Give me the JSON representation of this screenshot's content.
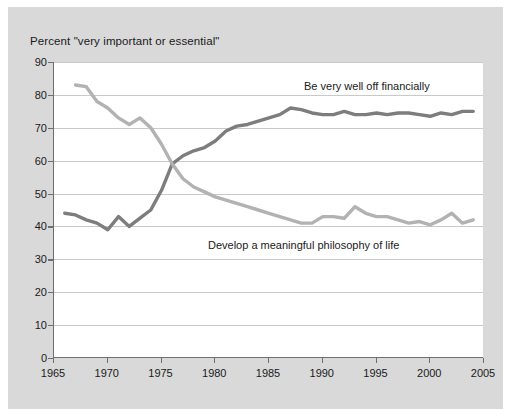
{
  "chart_data": {
    "type": "line",
    "title": "Percent \"very important or essential\"",
    "xlabel": "",
    "ylabel": "",
    "xlim": [
      1965,
      2005
    ],
    "ylim": [
      0,
      90
    ],
    "ytick_step": 10,
    "xtick_step": 5,
    "grid": true,
    "legend_position": "inline-annotation",
    "yticks": [
      "90",
      "80",
      "70",
      "60",
      "50",
      "40",
      "30",
      "20",
      "10",
      "0"
    ],
    "xticks": [
      "1965",
      "1970",
      "1975",
      "1980",
      "1985",
      "1990",
      "1995",
      "2000",
      "2005"
    ],
    "series": [
      {
        "name": "Be very well off financially",
        "color": "#7d7d7d",
        "x": [
          1966,
          1967,
          1968,
          1969,
          1970,
          1971,
          1972,
          1973,
          1974,
          1975,
          1976,
          1977,
          1978,
          1979,
          1980,
          1981,
          1982,
          1983,
          1984,
          1985,
          1986,
          1987,
          1988,
          1989,
          1990,
          1991,
          1992,
          1993,
          1994,
          1995,
          1996,
          1997,
          1998,
          1999,
          2000,
          2001,
          2002,
          2003,
          2004
        ],
        "values": [
          44,
          43.5,
          42,
          41,
          39,
          43,
          40,
          42.5,
          45,
          51,
          59,
          61.5,
          63,
          64,
          66,
          69,
          70.5,
          71,
          72,
          73,
          74,
          76,
          75.5,
          74.5,
          74,
          74,
          75,
          74,
          74,
          74.5,
          74,
          74.5,
          74.5,
          74,
          73.5,
          74.5,
          74,
          75,
          75
        ]
      },
      {
        "name": "Develop a meaningful philosophy of life",
        "color": "#b2b2b2",
        "x": [
          1967,
          1968,
          1969,
          1970,
          1971,
          1972,
          1973,
          1974,
          1975,
          1976,
          1977,
          1978,
          1979,
          1980,
          1981,
          1982,
          1983,
          1984,
          1985,
          1986,
          1987,
          1988,
          1989,
          1990,
          1991,
          1992,
          1993,
          1994,
          1995,
          1996,
          1997,
          1998,
          1999,
          2000,
          2001,
          2002,
          2003,
          2004
        ],
        "values": [
          83,
          82.5,
          78,
          76,
          73,
          71,
          73,
          70,
          65,
          59,
          54.5,
          52,
          50.5,
          49,
          48,
          47,
          46,
          45,
          44,
          43,
          42,
          41,
          41,
          43,
          43,
          42.5,
          46,
          44,
          43,
          43,
          42,
          41,
          41.5,
          40.5,
          42,
          44,
          41,
          42
        ]
      }
    ],
    "annotations": [
      {
        "text": "Be very well off financially",
        "series": "financial"
      },
      {
        "text": "Develop a meaningful philosophy of life",
        "series": "philosophy"
      }
    ]
  }
}
